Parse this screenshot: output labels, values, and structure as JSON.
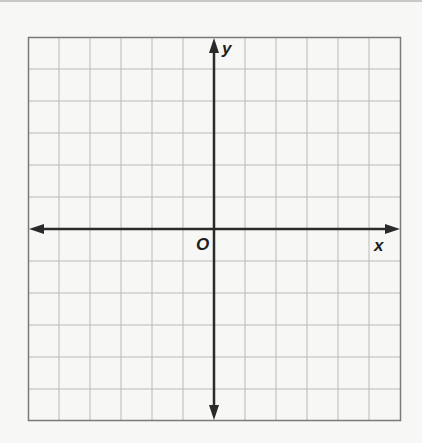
{
  "diagram": {
    "type": "coordinate-plane",
    "grid": {
      "columns": 12,
      "rows": 12,
      "x_range": [
        -6,
        6
      ],
      "y_range": [
        -6,
        6
      ],
      "gridline_color": "#b9b9b9",
      "border_color": "#7a7a7a"
    },
    "axes": {
      "color": "#2a2a2a",
      "x_label": "x",
      "y_label": "y",
      "origin_label": "O"
    }
  }
}
